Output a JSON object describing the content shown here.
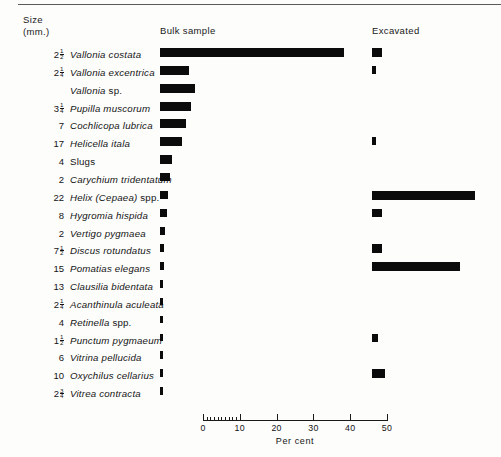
{
  "figure": {
    "size_header_line1": "Size",
    "size_header_line2": "(mm.)",
    "column_bulk": "Bulk sample",
    "column_excavated": "Excavated"
  },
  "chart_data": {
    "type": "bar",
    "title": "",
    "xlabel": "Per cent",
    "ylabel": "",
    "xlim": [
      0,
      50
    ],
    "grid": false,
    "orientation": "horizontal",
    "legend": [
      "Bulk sample",
      "Excavated"
    ],
    "axis": {
      "label": "Per cent",
      "ticks": [
        0,
        10,
        20,
        30,
        40,
        50
      ],
      "tick_labels": [
        "0",
        "10",
        "20",
        "30",
        "40",
        "50"
      ],
      "minor_ticks": [
        1,
        2,
        3,
        4,
        5,
        6,
        7,
        8,
        9
      ]
    },
    "categories": [
      "Vallonia costata",
      "Vallonia excentrica",
      "Vallonia sp.",
      "Pupilla muscorum",
      "Cochlicopa lubrica",
      "Helicella itala",
      "Slugs",
      "Carychium tridentatum",
      "Helix (Cepaea) spp.",
      "Hygromia hispida",
      "Vertigo pygmaea",
      "Discus rotundatus",
      "Pomatias elegans",
      "Clausilia bidentata",
      "Acanthinula aculeata",
      "Retinella spp.",
      "Punctum pygmaeum",
      "Vitrina pellucida",
      "Oxychilus cellarius",
      "Vitrea contracta"
    ],
    "sizes_mm": [
      "2 1/2",
      "2 1/4",
      "",
      "3 1/4",
      "7",
      "17",
      "4",
      "2",
      "22",
      "8",
      "2",
      "7 1/2",
      "15",
      "13",
      "2 1/4",
      "4",
      "1 1/2",
      "6",
      "10",
      "2 3/4"
    ],
    "series": [
      {
        "name": "Bulk sample",
        "values": [
          50.0,
          8.0,
          9.5,
          8.5,
          7.0,
          6.0,
          3.2,
          2.6,
          2.2,
          1.8,
          1.3,
          1.0,
          1.0,
          0.9,
          0.9,
          0.9,
          0.8,
          0.8,
          0.8,
          0.7
        ]
      },
      {
        "name": "Excavated",
        "values": [
          2.6,
          1.0,
          0.0,
          0.0,
          0.0,
          1.0,
          0.0,
          0.0,
          28.0,
          2.8,
          0.0,
          2.8,
          24.0,
          0.0,
          0.0,
          0.0,
          1.6,
          0.0,
          3.4,
          0.0
        ]
      }
    ]
  },
  "rows": [
    {
      "size_whole": "2",
      "size_num": "1",
      "size_den": "2",
      "name": "Vallonia costata",
      "roman": ""
    },
    {
      "size_whole": "2",
      "size_num": "1",
      "size_den": "4",
      "name": "Vallonia excentrica",
      "roman": ""
    },
    {
      "size_whole": "",
      "size_num": "",
      "size_den": "",
      "name": "Vallonia ",
      "roman": "sp."
    },
    {
      "size_whole": "3",
      "size_num": "1",
      "size_den": "4",
      "name": "Pupilla muscorum",
      "roman": ""
    },
    {
      "size_whole": "7",
      "size_num": "",
      "size_den": "",
      "name": "Cochlicopa lubrica",
      "roman": ""
    },
    {
      "size_whole": "17",
      "size_num": "",
      "size_den": "",
      "name": "Helicella itala",
      "roman": ""
    },
    {
      "size_whole": "4",
      "size_num": "",
      "size_den": "",
      "name": "",
      "roman": "Slugs"
    },
    {
      "size_whole": "2",
      "size_num": "",
      "size_den": "",
      "name": "Carychium tridentatum",
      "roman": ""
    },
    {
      "size_whole": "22",
      "size_num": "",
      "size_den": "",
      "name": "Helix (Cepaea) ",
      "roman": "spp."
    },
    {
      "size_whole": "8",
      "size_num": "",
      "size_den": "",
      "name": "Hygromia hispida",
      "roman": ""
    },
    {
      "size_whole": "2",
      "size_num": "",
      "size_den": "",
      "name": "Vertigo pygmaea",
      "roman": ""
    },
    {
      "size_whole": "7",
      "size_num": "1",
      "size_den": "2",
      "name": "Discus rotundatus",
      "roman": ""
    },
    {
      "size_whole": "15",
      "size_num": "",
      "size_den": "",
      "name": "Pomatias elegans",
      "roman": ""
    },
    {
      "size_whole": "13",
      "size_num": "",
      "size_den": "",
      "name": "Clausilia bidentata",
      "roman": ""
    },
    {
      "size_whole": "2",
      "size_num": "1",
      "size_den": "4",
      "name": "Acanthinula aculeata",
      "roman": ""
    },
    {
      "size_whole": "4",
      "size_num": "",
      "size_den": "",
      "name": "Retinella ",
      "roman": "spp."
    },
    {
      "size_whole": "1",
      "size_num": "1",
      "size_den": "2",
      "name": "Punctum pygmaeum",
      "roman": ""
    },
    {
      "size_whole": "6",
      "size_num": "",
      "size_den": "",
      "name": "Vitrina pellucida",
      "roman": ""
    },
    {
      "size_whole": "10",
      "size_num": "",
      "size_den": "",
      "name": "Oxychilus cellarius",
      "roman": ""
    },
    {
      "size_whole": "2",
      "size_num": "3",
      "size_den": "4",
      "name": "Vitrea contracta",
      "roman": ""
    }
  ],
  "style": {
    "bar_color": "#0b0b0b",
    "text_color": "#141414",
    "background": "#fdfdfc"
  }
}
